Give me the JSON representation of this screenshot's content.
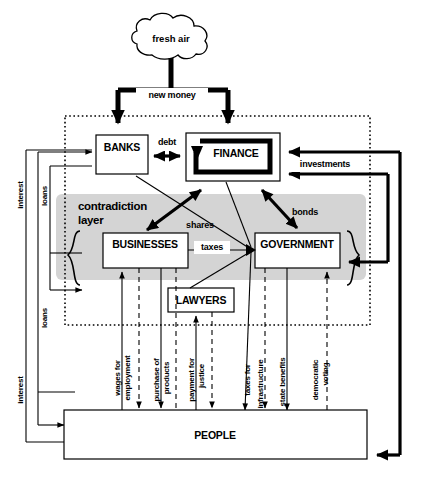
{
  "diagram": {
    "colors": {
      "background": "#ffffff",
      "layer_gray": "#d4d4d4",
      "stroke": "#000000"
    },
    "cloud": {
      "label": "fresh air"
    },
    "layer": {
      "line1": "contradiction",
      "line2": "layer"
    },
    "nodes": [
      {
        "id": "banks",
        "label": "BANKS"
      },
      {
        "id": "finance",
        "label": "FINANCE"
      },
      {
        "id": "businesses",
        "label": "BUSINESSES"
      },
      {
        "id": "government",
        "label": "GOVERNMENT"
      },
      {
        "id": "lawyers",
        "label": "LAWYERS"
      },
      {
        "id": "people",
        "label": "PEOPLE"
      }
    ],
    "edges": [
      {
        "id": "new-money",
        "label": "new money",
        "style": "thick"
      },
      {
        "id": "debt",
        "label": "debt",
        "style": "thick-bidirectional"
      },
      {
        "id": "shares",
        "label": "shares",
        "style": "thick-bidirectional"
      },
      {
        "id": "bonds",
        "label": "bonds",
        "style": "thick-bidirectional"
      },
      {
        "id": "taxes",
        "label": "taxes",
        "style": "thin"
      },
      {
        "id": "investments",
        "label": "investments",
        "style": "thick"
      }
    ],
    "side_labels": [
      {
        "id": "interest-top",
        "label": "interest",
        "orientation": "vertical"
      },
      {
        "id": "loans-top",
        "label": "loans",
        "orientation": "vertical"
      },
      {
        "id": "loans-bottom",
        "label": "loans",
        "orientation": "vertical"
      },
      {
        "id": "interest-bottom",
        "label": "interest",
        "orientation": "vertical"
      }
    ],
    "bottom_labels": [
      {
        "id": "wages",
        "line1": "wages for",
        "line2": "employment",
        "style": "solid"
      },
      {
        "id": "purchase",
        "line1": "purchase of",
        "line2": "products",
        "style": "solid"
      },
      {
        "id": "payment-justice",
        "line1": "payment for",
        "line2": "justice",
        "style": "solid"
      },
      {
        "id": "taxes-infra",
        "line1": "taxes for",
        "line2": "infrastructure",
        "style": "solid"
      },
      {
        "id": "state-benefits",
        "line1": "state benefits",
        "line2": "",
        "style": "solid"
      },
      {
        "id": "democratic",
        "line1": "democratic",
        "line2": "voting",
        "style": "dashed"
      }
    ]
  }
}
